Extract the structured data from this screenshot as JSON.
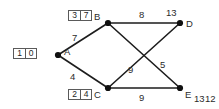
{
  "diagram": {
    "nodes": [
      {
        "id": "A",
        "label": "A",
        "x": 58,
        "y": 55,
        "tag": [
          "1",
          "0"
        ],
        "tag_x": 13,
        "tag_y": 48,
        "label_x": 64,
        "label_y": 47
      },
      {
        "id": "B",
        "label": "B",
        "x": 108,
        "y": 23,
        "tag": [
          "3",
          "7"
        ],
        "tag_x": 68,
        "tag_y": 10,
        "label_x": 94,
        "label_y": 12
      },
      {
        "id": "C",
        "label": "C",
        "x": 108,
        "y": 88,
        "tag": [
          "2",
          "4"
        ],
        "tag_x": 68,
        "tag_y": 89,
        "label_x": 94,
        "label_y": 90
      },
      {
        "id": "D",
        "label": "D",
        "x": 180,
        "y": 23,
        "tag": null,
        "label_x": 186,
        "label_y": 19
      },
      {
        "id": "E",
        "label": "E",
        "x": 180,
        "y": 88,
        "tag": null,
        "label_x": 185,
        "label_y": 90
      }
    ],
    "node_distance_labels": [
      {
        "for": "D",
        "text": "13",
        "x": 166,
        "y": 8
      },
      {
        "for": "E",
        "text": "13",
        "x": 194,
        "y": 94
      },
      {
        "for": "E",
        "text": "12",
        "x": 205,
        "y": 94
      }
    ],
    "edges": [
      {
        "from": "A",
        "to": "B",
        "weight": "7",
        "label_x": 72,
        "label_y": 33
      },
      {
        "from": "A",
        "to": "C",
        "weight": "4",
        "label_x": 70,
        "label_y": 72
      },
      {
        "from": "B",
        "to": "D",
        "weight": "8",
        "label_x": 139,
        "label_y": 10
      },
      {
        "from": "C",
        "to": "E",
        "weight": "9",
        "label_x": 139,
        "label_y": 93
      },
      {
        "from": "C",
        "to": "D",
        "weight": "9",
        "label_x": 128,
        "label_y": 65
      },
      {
        "from": "B",
        "to": "E",
        "weight": "5",
        "label_x": 160,
        "label_y": 60
      }
    ],
    "colors": {
      "edge": "#1d1d1d",
      "node": "#101010",
      "text": "#2b2b2b",
      "box_border": "#5a5a5a",
      "background": "#ffffff"
    }
  }
}
